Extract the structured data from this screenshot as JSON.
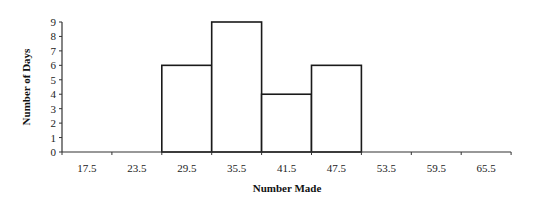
{
  "chart_data": {
    "type": "bar",
    "subtype": "histogram",
    "title": "",
    "xlabel": "Number Made",
    "ylabel": "Number of Days",
    "categories": [
      "17.5",
      "23.5",
      "29.5",
      "35.5",
      "41.5",
      "47.5",
      "53.5",
      "59.5",
      "65.5"
    ],
    "values": [
      0,
      0,
      6,
      9,
      4,
      6,
      0,
      0,
      0
    ],
    "y_ticks": [
      0,
      1,
      2,
      3,
      4,
      5,
      6,
      7,
      8,
      9
    ],
    "ylim": [
      0,
      9
    ],
    "grid": false,
    "legend": null,
    "colors": {
      "bar_fill": "#ffffff",
      "bar_stroke": "#1a1a1a",
      "axis": "#333333"
    }
  }
}
